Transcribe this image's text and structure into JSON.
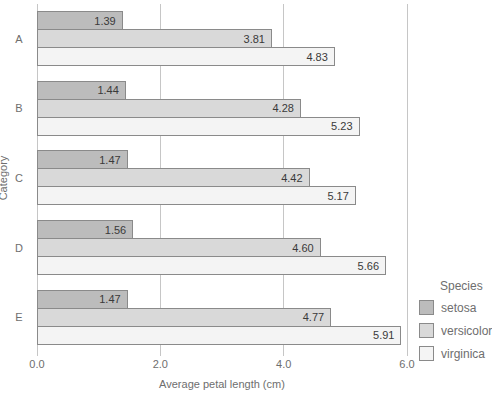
{
  "chart_data": {
    "type": "bar",
    "orientation": "horizontal",
    "title": "",
    "xlabel": "Average petal length (cm)",
    "ylabel": "Category",
    "categories": [
      "A",
      "B",
      "C",
      "D",
      "E"
    ],
    "series": [
      {
        "name": "setosa",
        "color": "#bcbcbc",
        "values": [
          1.39,
          1.44,
          1.47,
          1.56,
          1.47
        ],
        "labels": [
          "1.39",
          "1.44",
          "1.47",
          "1.56",
          "1.47"
        ]
      },
      {
        "name": "versicolor",
        "color": "#d9d9d9",
        "values": [
          3.81,
          4.28,
          4.42,
          4.6,
          4.77
        ],
        "labels": [
          "3.81",
          "4.28",
          "4.42",
          "4.60",
          "4.77"
        ]
      },
      {
        "name": "virginica",
        "color": "#f4f4f4",
        "values": [
          4.83,
          5.23,
          5.17,
          5.66,
          5.91
        ],
        "labels": [
          "4.83",
          "5.23",
          "5.17",
          "5.66",
          "5.91"
        ]
      }
    ],
    "xlim": [
      0,
      6
    ],
    "xticks": {
      "values": [
        0,
        2,
        4,
        6
      ],
      "labels": [
        "0.0",
        "2.0",
        "4.0",
        "6.0"
      ]
    },
    "grid": true,
    "legend": {
      "title": "Species",
      "position": "right",
      "entries": [
        "setosa",
        "versicolor",
        "virginica"
      ]
    }
  },
  "style": {
    "background": "#ffffff",
    "bar_border": "#8a8a8a",
    "grid_color": "#c6c6c6",
    "axis_text_color": "#6e6e6e",
    "value_text_color": "#3a3a3a"
  }
}
